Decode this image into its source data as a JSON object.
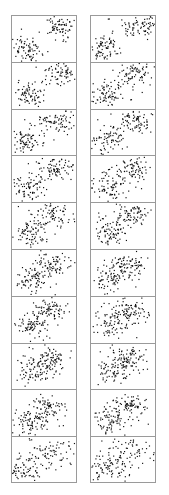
{
  "figure": {
    "title": "",
    "background_color": "#ffffff",
    "border_color": "#9a9a9a",
    "point_color": "#101010",
    "columns": 2,
    "rows": 10,
    "column_left_x": 11,
    "column_right_x": 90,
    "panel_width": 66,
    "panel_height": 46.8,
    "top_y": 15
  },
  "chart_data": {
    "type": "scatter",
    "title": "",
    "subtitle": "",
    "xlabel": "",
    "ylabel": "",
    "xlim": [
      0,
      1
    ],
    "ylim": [
      0,
      1
    ],
    "grid": false,
    "legend": "none",
    "axis_ticks": "none",
    "panels": [
      {
        "id": "left-1",
        "column": "left",
        "row": 1,
        "separation": 1.0,
        "n_points": 160,
        "clusters": [
          {
            "name": "lower-left",
            "cx": 0.22,
            "cy": 0.26,
            "sx": 0.13,
            "sy": 0.15,
            "n": 82
          },
          {
            "name": "upper-right",
            "cx": 0.76,
            "cy": 0.8,
            "sx": 0.15,
            "sy": 0.14,
            "n": 78
          }
        ]
      },
      {
        "id": "right-1",
        "column": "right",
        "row": 1,
        "separation": 0.96,
        "n_points": 160,
        "clusters": [
          {
            "name": "lower-left",
            "cx": 0.23,
            "cy": 0.28,
            "sx": 0.13,
            "sy": 0.15,
            "n": 80
          },
          {
            "name": "upper-right",
            "cx": 0.74,
            "cy": 0.8,
            "sx": 0.16,
            "sy": 0.14,
            "n": 80
          }
        ]
      },
      {
        "id": "left-2",
        "column": "left",
        "row": 2,
        "separation": 0.88,
        "n_points": 160,
        "clusters": [
          {
            "name": "lower-left",
            "cx": 0.24,
            "cy": 0.3,
            "sx": 0.13,
            "sy": 0.16,
            "n": 82
          },
          {
            "name": "upper-right",
            "cx": 0.73,
            "cy": 0.78,
            "sx": 0.15,
            "sy": 0.14,
            "n": 78
          }
        ]
      },
      {
        "id": "right-2",
        "column": "right",
        "row": 2,
        "separation": 0.84,
        "n_points": 160,
        "clusters": [
          {
            "name": "lower-left",
            "cx": 0.25,
            "cy": 0.31,
            "sx": 0.14,
            "sy": 0.16,
            "n": 80
          },
          {
            "name": "upper-right",
            "cx": 0.71,
            "cy": 0.77,
            "sx": 0.15,
            "sy": 0.14,
            "n": 80
          }
        ]
      },
      {
        "id": "left-3",
        "column": "left",
        "row": 3,
        "separation": 0.78,
        "n_points": 160,
        "clusters": [
          {
            "name": "lower-left",
            "cx": 0.25,
            "cy": 0.32,
            "sx": 0.14,
            "sy": 0.16,
            "n": 82
          },
          {
            "name": "upper-right",
            "cx": 0.7,
            "cy": 0.76,
            "sx": 0.15,
            "sy": 0.14,
            "n": 78
          }
        ]
      },
      {
        "id": "right-3",
        "column": "right",
        "row": 3,
        "separation": 0.74,
        "n_points": 160,
        "clusters": [
          {
            "name": "lower-left",
            "cx": 0.26,
            "cy": 0.33,
            "sx": 0.14,
            "sy": 0.16,
            "n": 80
          },
          {
            "name": "upper-right",
            "cx": 0.69,
            "cy": 0.75,
            "sx": 0.15,
            "sy": 0.14,
            "n": 80
          }
        ]
      },
      {
        "id": "left-4",
        "column": "left",
        "row": 4,
        "separation": 0.68,
        "n_points": 160,
        "clusters": [
          {
            "name": "lower-left",
            "cx": 0.27,
            "cy": 0.34,
            "sx": 0.14,
            "sy": 0.16,
            "n": 82
          },
          {
            "name": "upper-right",
            "cx": 0.68,
            "cy": 0.74,
            "sx": 0.15,
            "sy": 0.14,
            "n": 78
          }
        ]
      },
      {
        "id": "right-4",
        "column": "right",
        "row": 4,
        "separation": 0.64,
        "n_points": 160,
        "clusters": [
          {
            "name": "lower-left",
            "cx": 0.28,
            "cy": 0.35,
            "sx": 0.14,
            "sy": 0.16,
            "n": 80
          },
          {
            "name": "upper-right",
            "cx": 0.67,
            "cy": 0.73,
            "sx": 0.15,
            "sy": 0.14,
            "n": 80
          }
        ]
      },
      {
        "id": "left-5",
        "column": "left",
        "row": 5,
        "separation": 0.58,
        "n_points": 160,
        "clusters": [
          {
            "name": "lower-left",
            "cx": 0.29,
            "cy": 0.36,
            "sx": 0.14,
            "sy": 0.16,
            "n": 82
          },
          {
            "name": "upper-right",
            "cx": 0.66,
            "cy": 0.72,
            "sx": 0.15,
            "sy": 0.14,
            "n": 78
          }
        ]
      },
      {
        "id": "right-5",
        "column": "right",
        "row": 5,
        "separation": 0.54,
        "n_points": 160,
        "clusters": [
          {
            "name": "lower-left",
            "cx": 0.3,
            "cy": 0.37,
            "sx": 0.14,
            "sy": 0.16,
            "n": 80
          },
          {
            "name": "upper-right",
            "cx": 0.65,
            "cy": 0.71,
            "sx": 0.15,
            "sy": 0.14,
            "n": 80
          }
        ]
      },
      {
        "id": "left-6",
        "column": "left",
        "row": 6,
        "separation": 0.48,
        "n_points": 160,
        "clusters": [
          {
            "name": "lower-left",
            "cx": 0.31,
            "cy": 0.38,
            "sx": 0.15,
            "sy": 0.16,
            "n": 82
          },
          {
            "name": "upper-right",
            "cx": 0.64,
            "cy": 0.7,
            "sx": 0.15,
            "sy": 0.14,
            "n": 78
          }
        ]
      },
      {
        "id": "right-6",
        "column": "right",
        "row": 6,
        "separation": 0.44,
        "n_points": 160,
        "clusters": [
          {
            "name": "lower-left",
            "cx": 0.32,
            "cy": 0.39,
            "sx": 0.15,
            "sy": 0.16,
            "n": 80
          },
          {
            "name": "upper-right",
            "cx": 0.63,
            "cy": 0.69,
            "sx": 0.15,
            "sy": 0.14,
            "n": 80
          }
        ]
      },
      {
        "id": "left-7",
        "column": "left",
        "row": 7,
        "separation": 0.38,
        "n_points": 160,
        "clusters": [
          {
            "name": "lower-left",
            "cx": 0.33,
            "cy": 0.4,
            "sx": 0.15,
            "sy": 0.16,
            "n": 82
          },
          {
            "name": "upper-right",
            "cx": 0.62,
            "cy": 0.68,
            "sx": 0.15,
            "sy": 0.14,
            "n": 78
          }
        ]
      },
      {
        "id": "right-7",
        "column": "right",
        "row": 7,
        "separation": 0.34,
        "n_points": 160,
        "clusters": [
          {
            "name": "lower-left",
            "cx": 0.34,
            "cy": 0.41,
            "sx": 0.15,
            "sy": 0.16,
            "n": 80
          },
          {
            "name": "upper-right",
            "cx": 0.61,
            "cy": 0.67,
            "sx": 0.15,
            "sy": 0.14,
            "n": 80
          }
        ]
      },
      {
        "id": "left-8",
        "column": "left",
        "row": 8,
        "separation": 0.28,
        "n_points": 160,
        "clusters": [
          {
            "name": "lower-left",
            "cx": 0.34,
            "cy": 0.42,
            "sx": 0.15,
            "sy": 0.16,
            "n": 82
          },
          {
            "name": "upper-right",
            "cx": 0.6,
            "cy": 0.66,
            "sx": 0.15,
            "sy": 0.14,
            "n": 78
          }
        ]
      },
      {
        "id": "right-8",
        "column": "right",
        "row": 8,
        "separation": 0.24,
        "n_points": 160,
        "clusters": [
          {
            "name": "lower-left",
            "cx": 0.35,
            "cy": 0.43,
            "sx": 0.15,
            "sy": 0.16,
            "n": 80
          },
          {
            "name": "upper-right",
            "cx": 0.59,
            "cy": 0.65,
            "sx": 0.15,
            "sy": 0.14,
            "n": 80
          }
        ]
      },
      {
        "id": "left-9",
        "column": "left",
        "row": 9,
        "separation": 0.16,
        "n_points": 160,
        "clusters": [
          {
            "name": "lower-left",
            "cx": 0.3,
            "cy": 0.3,
            "sx": 0.15,
            "sy": 0.15,
            "n": 82
          },
          {
            "name": "upper-right",
            "cx": 0.58,
            "cy": 0.62,
            "sx": 0.16,
            "sy": 0.15,
            "n": 78
          }
        ]
      },
      {
        "id": "right-9",
        "column": "right",
        "row": 9,
        "separation": 0.12,
        "n_points": 160,
        "clusters": [
          {
            "name": "lower-left",
            "cx": 0.32,
            "cy": 0.33,
            "sx": 0.15,
            "sy": 0.15,
            "n": 80
          },
          {
            "name": "upper-right",
            "cx": 0.6,
            "cy": 0.64,
            "sx": 0.16,
            "sy": 0.15,
            "n": 80
          }
        ]
      },
      {
        "id": "left-10",
        "column": "left",
        "row": 10,
        "separation": 0.0,
        "n_points": 160,
        "clusters": [
          {
            "name": "merged-lower",
            "cx": 0.2,
            "cy": 0.22,
            "sx": 0.12,
            "sy": 0.13,
            "n": 70
          },
          {
            "name": "merged-upper",
            "cx": 0.6,
            "cy": 0.66,
            "sx": 0.22,
            "sy": 0.2,
            "n": 90
          }
        ]
      },
      {
        "id": "right-10",
        "column": "right",
        "row": 10,
        "separation": 0.0,
        "n_points": 160,
        "clusters": [
          {
            "name": "merged-lower",
            "cx": 0.26,
            "cy": 0.28,
            "sx": 0.16,
            "sy": 0.16,
            "n": 80
          },
          {
            "name": "merged-upper",
            "cx": 0.62,
            "cy": 0.68,
            "sx": 0.2,
            "sy": 0.18,
            "n": 80
          }
        ]
      }
    ]
  }
}
